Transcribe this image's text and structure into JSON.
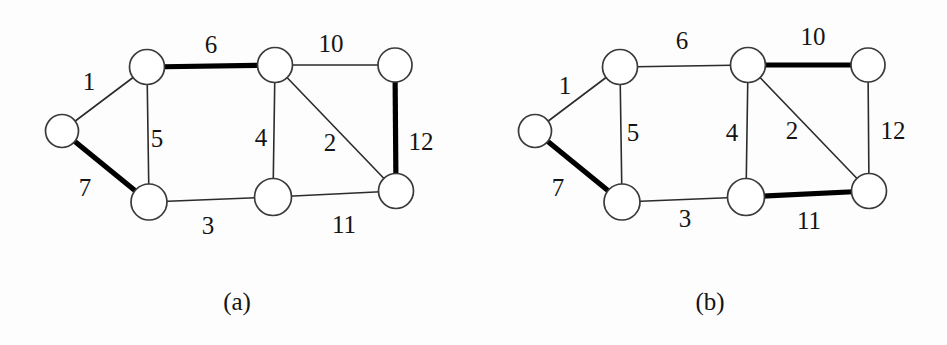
{
  "figure": {
    "background_color": "#fdfdfd",
    "edge_color_thin": "#2b2b2b",
    "edge_color_bold": "#000000",
    "node_fill": "#ffffff",
    "node_stroke": "#3a3a3a",
    "label_color": "#151515"
  },
  "panels": [
    {
      "id": "a",
      "caption": "(a)",
      "edge_labels": {
        "e1": "1",
        "e7": "7",
        "e5": "5",
        "e6": "6",
        "e3": "3",
        "e4": "4",
        "e10": "10",
        "e2": "2",
        "e11": "11",
        "e12": "12"
      },
      "bold_edges": [
        "6",
        "7",
        "12"
      ],
      "thin_edges": [
        "1",
        "2",
        "3",
        "4",
        "5",
        "10",
        "11"
      ]
    },
    {
      "id": "b",
      "caption": "(b)",
      "edge_labels": {
        "e1": "1",
        "e7": "7",
        "e5": "5",
        "e6": "6",
        "e3": "3",
        "e4": "4",
        "e10": "10",
        "e2": "2",
        "e11": "11",
        "e12": "12"
      },
      "bold_edges": [
        "7",
        "10",
        "11"
      ],
      "thin_edges": [
        "1",
        "2",
        "3",
        "4",
        "5",
        "6",
        "12"
      ]
    }
  ],
  "graph_structure": {
    "node_count": 7,
    "node_ids": [
      "v-left",
      "v-top-left",
      "v-top-mid",
      "v-top-right",
      "v-bot-left",
      "v-bot-mid",
      "v-bot-right"
    ],
    "edges": [
      {
        "label": "1",
        "from": "v-left",
        "to": "v-top-left"
      },
      {
        "label": "7",
        "from": "v-left",
        "to": "v-bot-left"
      },
      {
        "label": "5",
        "from": "v-top-left",
        "to": "v-bot-left"
      },
      {
        "label": "6",
        "from": "v-top-left",
        "to": "v-top-mid"
      },
      {
        "label": "3",
        "from": "v-bot-left",
        "to": "v-bot-mid"
      },
      {
        "label": "4",
        "from": "v-top-mid",
        "to": "v-bot-mid"
      },
      {
        "label": "10",
        "from": "v-top-mid",
        "to": "v-top-right"
      },
      {
        "label": "2",
        "from": "v-top-mid",
        "to": "v-bot-right"
      },
      {
        "label": "11",
        "from": "v-bot-mid",
        "to": "v-bot-right"
      },
      {
        "label": "12",
        "from": "v-top-right",
        "to": "v-bot-right"
      }
    ]
  }
}
